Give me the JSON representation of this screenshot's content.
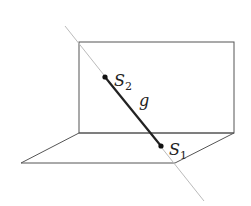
{
  "diagram": {
    "labels": {
      "s2": "S",
      "s2_sub": "2",
      "s1": "S",
      "s1_sub": "1",
      "g": "g"
    },
    "colors": {
      "plane_stroke": "#555555",
      "line_light": "#bbbbbb",
      "segment": "#222222",
      "point": "#111111"
    },
    "points": {
      "S2": [
        105,
        77
      ],
      "S1": [
        161,
        146
      ]
    },
    "vertical_plane": {
      "x": 79,
      "y": 42,
      "width": 155,
      "height": 91
    },
    "horizontal_plane": [
      [
        79,
        133
      ],
      [
        234,
        133
      ],
      [
        175,
        163
      ],
      [
        21,
        163
      ]
    ],
    "line_g_extended": [
      [
        65,
        26
      ],
      [
        204,
        201
      ]
    ]
  }
}
